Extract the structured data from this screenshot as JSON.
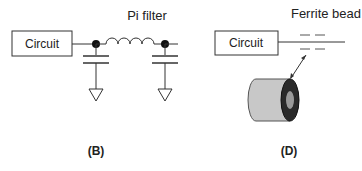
{
  "panels": [
    {
      "id": "B",
      "caption": "(B)",
      "title": "Pi filter",
      "block_label": "Circuit",
      "components": [
        "inductor",
        "capacitor",
        "capacitor",
        "ground",
        "ground"
      ]
    },
    {
      "id": "D",
      "caption": "(D)",
      "title": "Ferrite bead",
      "block_label": "Circuit",
      "components": [
        "ferrite-bead-symbol",
        "ferrite-bead-illustration",
        "double-arrow"
      ]
    }
  ],
  "colors": {
    "line": "#333333",
    "bead_body": "#c8c8c8",
    "bead_end": "#2a2a2a",
    "bead_hole": "#9a9a9a"
  }
}
